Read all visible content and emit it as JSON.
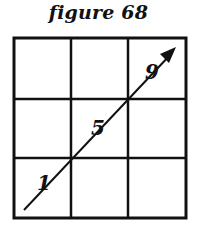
{
  "figure": {
    "title": "figure 68",
    "grid": {
      "rows": 3,
      "cols": 3,
      "x_lines": [
        14,
        71,
        128,
        186
      ],
      "y_lines": [
        38,
        99,
        158,
        218
      ],
      "stroke_color": "#111111"
    },
    "arrow": {
      "from": [
        24,
        210
      ],
      "to": [
        174,
        51
      ],
      "direction": "up-right"
    },
    "labels": [
      {
        "text": "1",
        "cell": "bottom-left"
      },
      {
        "text": "5",
        "cell": "center"
      },
      {
        "text": "9",
        "cell": "top-right"
      }
    ]
  }
}
